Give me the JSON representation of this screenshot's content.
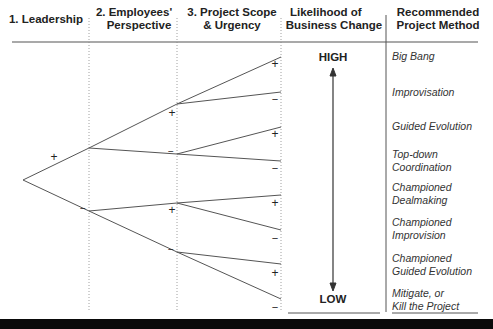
{
  "headers": {
    "leadership": "1. Leadership",
    "employees": "2. Employees' Perspective",
    "employees_line1": "2. Employees'",
    "employees_line2": "Perspective",
    "scope_line1": "3. Project Scope",
    "scope_line2": "& Urgency",
    "likelihood_line1": "Likelihood of",
    "likelihood_line2": "Business Change",
    "method_line1": "Recommended",
    "method_line2": "Project Method"
  },
  "likelihood": {
    "high_label": "HIGH",
    "low_label": "LOW"
  },
  "tree": {
    "level1_signs": [
      "+",
      "−"
    ],
    "level2_signs": [
      "+",
      "−",
      "+",
      "−"
    ],
    "level3_signs": [
      "+",
      "−",
      "+",
      "−",
      "+",
      "−",
      "+",
      "−"
    ]
  },
  "methods": [
    {
      "line1": "Big Bang",
      "line2": ""
    },
    {
      "line1": "Improvisation",
      "line2": ""
    },
    {
      "line1": "Guided Evolution",
      "line2": ""
    },
    {
      "line1": "Top-down",
      "line2": "Coordination"
    },
    {
      "line1": "Championed",
      "line2": "Dealmaking"
    },
    {
      "line1": "Championed",
      "line2": "Improvision"
    },
    {
      "line1": "Championed",
      "line2": "Guided Evolution"
    },
    {
      "line1": "Mitigate, or",
      "line2": "Kill the Project"
    }
  ],
  "colors": {
    "line": "#555555",
    "text": "#222222",
    "bar": "#0a0a0a"
  }
}
